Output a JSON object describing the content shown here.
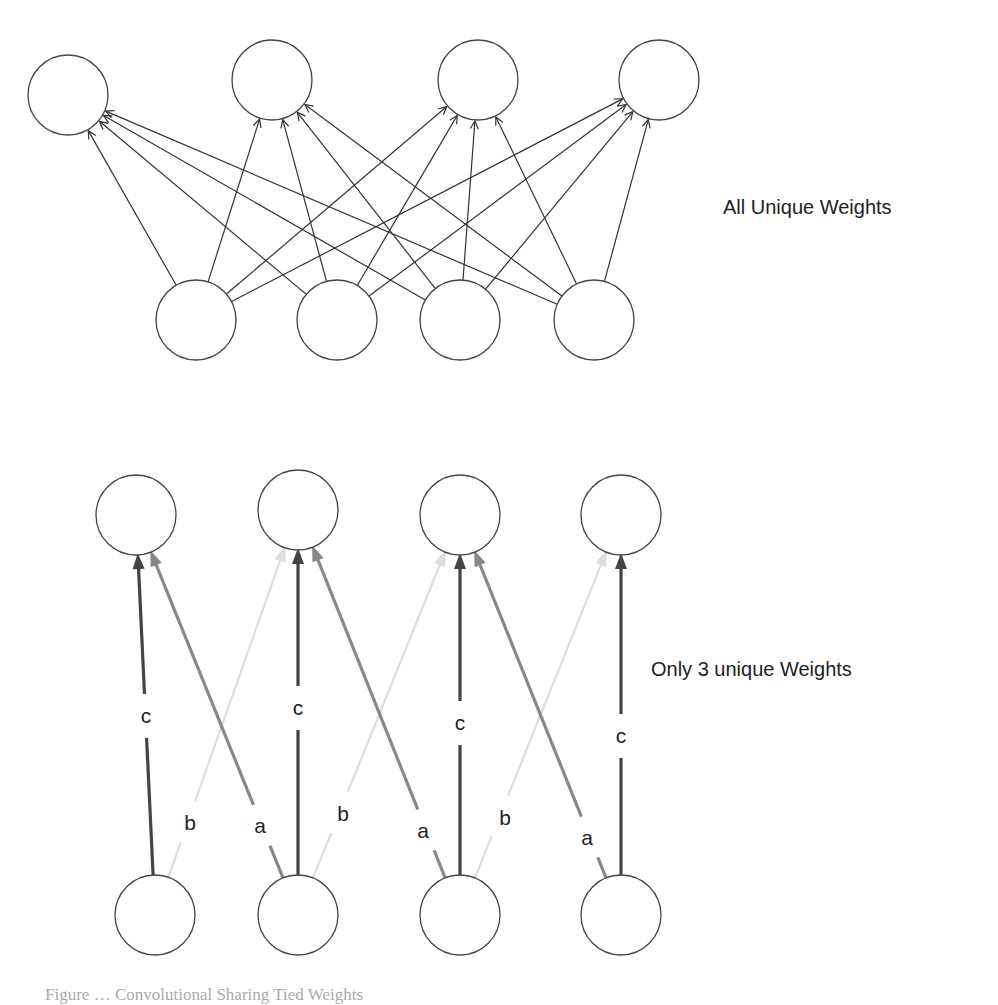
{
  "diagrams": [
    {
      "id": "fully-connected",
      "label": "All Unique Weights",
      "label_pos": {
        "x": 723,
        "y": 208
      },
      "node_radius": 40,
      "output_nodes": [
        {
          "x": 68,
          "y": 95
        },
        {
          "x": 272,
          "y": 80
        },
        {
          "x": 478,
          "y": 80
        },
        {
          "x": 659,
          "y": 80
        }
      ],
      "input_nodes": [
        {
          "x": 196,
          "y": 320
        },
        {
          "x": 337,
          "y": 320
        },
        {
          "x": 460,
          "y": 320
        },
        {
          "x": 594,
          "y": 320
        }
      ],
      "edge_color": "#333333",
      "edges": "all-to-all"
    },
    {
      "id": "shared-weights",
      "label": "Only 3 unique Weights",
      "label_pos": {
        "x": 651,
        "y": 670
      },
      "node_radius": 40,
      "output_nodes": [
        {
          "x": 136,
          "y": 515
        },
        {
          "x": 298,
          "y": 510
        },
        {
          "x": 460,
          "y": 515
        },
        {
          "x": 621,
          "y": 515
        }
      ],
      "input_nodes": [
        {
          "x": 155,
          "y": 915
        },
        {
          "x": 298,
          "y": 915
        },
        {
          "x": 460,
          "y": 915
        },
        {
          "x": 621,
          "y": 915
        }
      ],
      "weights": {
        "a": {
          "color": "#888888",
          "width": 3.2
        },
        "b": {
          "color": "#dddddd",
          "width": 2.2
        },
        "c": {
          "color": "#444444",
          "width": 3.2
        }
      },
      "edges": [
        {
          "from": 0,
          "to": 0,
          "weight": "c",
          "label_pos": {
            "x": 146,
            "y": 716
          }
        },
        {
          "from": 0,
          "to": 1,
          "weight": "b",
          "label_pos": {
            "x": 190,
            "y": 823
          }
        },
        {
          "from": 1,
          "to": 0,
          "weight": "a",
          "label_pos": {
            "x": 260,
            "y": 826
          }
        },
        {
          "from": 1,
          "to": 1,
          "weight": "c",
          "label_pos": {
            "x": 298,
            "y": 708
          }
        },
        {
          "from": 1,
          "to": 2,
          "weight": "b",
          "label_pos": {
            "x": 343,
            "y": 814
          }
        },
        {
          "from": 2,
          "to": 1,
          "weight": "a",
          "label_pos": {
            "x": 423,
            "y": 831
          }
        },
        {
          "from": 2,
          "to": 2,
          "weight": "c",
          "label_pos": {
            "x": 460,
            "y": 723
          }
        },
        {
          "from": 2,
          "to": 3,
          "weight": "b",
          "label_pos": {
            "x": 505,
            "y": 818
          }
        },
        {
          "from": 3,
          "to": 2,
          "weight": "a",
          "label_pos": {
            "x": 587,
            "y": 838
          }
        },
        {
          "from": 3,
          "to": 3,
          "weight": "c",
          "label_pos": {
            "x": 621,
            "y": 736
          }
        }
      ]
    }
  ],
  "caption": "Figure … Convolutional Sharing Tied Weights"
}
